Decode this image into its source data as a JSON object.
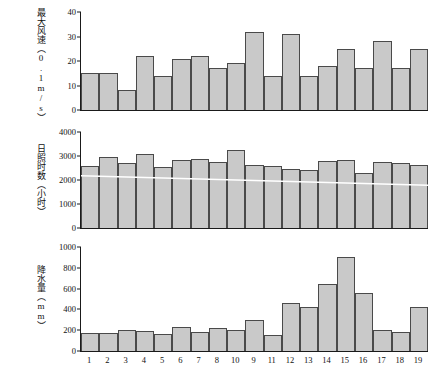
{
  "figure": {
    "background": "#ffffff",
    "bar_fill": "#c9c9c9",
    "bar_stroke": "#4a4a4a",
    "axis_color": "#1a1a1a",
    "trend_color": "#ffffff"
  },
  "xaxis": {
    "categories": [
      "1",
      "2",
      "3",
      "4",
      "5",
      "6",
      "7",
      "8",
      "10",
      "9",
      "11",
      "12",
      "13",
      "14",
      "15",
      "16",
      "17",
      "18",
      "19"
    ]
  },
  "chart_data": [
    {
      "type": "bar",
      "title": "",
      "ylabel": "最大风速（0.1m/s）",
      "ylabel_cjk": "最大风速",
      "ylabel_unit": "（0.1m/s）",
      "xlabel": "",
      "ylim": [
        0,
        40
      ],
      "yticks": [
        0,
        10,
        20,
        30,
        40
      ],
      "grid": false,
      "legend": "none",
      "categories": [
        "1",
        "2",
        "3",
        "4",
        "5",
        "6",
        "7",
        "8",
        "10",
        "9",
        "11",
        "12",
        "13",
        "14",
        "15",
        "16",
        "17",
        "18",
        "19"
      ],
      "values": [
        15,
        15,
        8,
        22,
        14,
        21,
        22,
        17,
        19,
        32,
        14,
        31,
        14,
        18,
        25,
        17,
        28,
        17,
        25
      ]
    },
    {
      "type": "bar",
      "title": "",
      "ylabel": "日照时数（小时）",
      "ylabel_cjk": "日照时数",
      "ylabel_unit": "（小时）",
      "xlabel": "",
      "ylim": [
        0,
        4000
      ],
      "yticks": [
        0,
        1000,
        2000,
        3000,
        4000
      ],
      "grid": false,
      "legend": "none",
      "categories": [
        "1",
        "2",
        "3",
        "4",
        "5",
        "6",
        "7",
        "8",
        "10",
        "9",
        "11",
        "12",
        "13",
        "14",
        "15",
        "16",
        "17",
        "18",
        "19"
      ],
      "values": [
        2600,
        2970,
        2720,
        3080,
        2560,
        2840,
        2880,
        2730,
        3230,
        2620,
        2600,
        2450,
        2400,
        2780,
        2840,
        2310,
        2760,
        2700,
        2640
      ],
      "trendline": {
        "type": "linear",
        "color": "#ffffff",
        "y_start": 2180,
        "y_end": 1780
      }
    },
    {
      "type": "bar",
      "title": "",
      "ylabel": "降水量（mm）",
      "ylabel_cjk": "降水量",
      "ylabel_unit": "（mm）",
      "xlabel": "",
      "ylim": [
        0,
        1000
      ],
      "yticks": [
        0,
        200,
        400,
        600,
        800,
        1000
      ],
      "grid": false,
      "legend": "none",
      "categories": [
        "1",
        "2",
        "3",
        "4",
        "5",
        "6",
        "7",
        "8",
        "10",
        "9",
        "11",
        "12",
        "13",
        "14",
        "15",
        "16",
        "17",
        "18",
        "19"
      ],
      "values": [
        175,
        170,
        200,
        190,
        160,
        235,
        185,
        225,
        205,
        300,
        150,
        465,
        425,
        640,
        900,
        555,
        200,
        185,
        420
      ]
    }
  ]
}
